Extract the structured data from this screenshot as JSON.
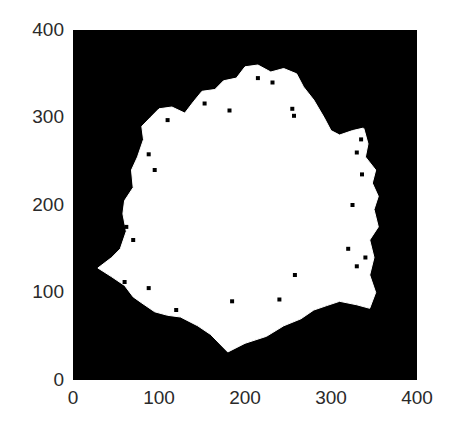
{
  "chart_data": {
    "type": "heatmap",
    "title": "",
    "xlabel": "",
    "ylabel": "",
    "xlim": [
      0,
      400
    ],
    "ylim": [
      0,
      400
    ],
    "x_ticks": [
      "0",
      "100",
      "200",
      "300",
      "400"
    ],
    "y_ticks": [
      "0",
      "100",
      "200",
      "300",
      "400"
    ],
    "grid": false,
    "legend": null,
    "colors": {
      "background": "#000000",
      "foreground": "#ffffff"
    },
    "blob_outline_approx": [
      [
        29,
        128
      ],
      [
        45,
        140
      ],
      [
        55,
        150
      ],
      [
        62,
        170
      ],
      [
        58,
        190
      ],
      [
        60,
        205
      ],
      [
        70,
        220
      ],
      [
        68,
        240
      ],
      [
        75,
        255
      ],
      [
        82,
        275
      ],
      [
        80,
        290
      ],
      [
        90,
        300
      ],
      [
        100,
        310
      ],
      [
        115,
        312
      ],
      [
        130,
        305
      ],
      [
        140,
        318
      ],
      [
        150,
        330
      ],
      [
        165,
        332
      ],
      [
        175,
        342
      ],
      [
        190,
        345
      ],
      [
        200,
        358
      ],
      [
        215,
        360
      ],
      [
        230,
        352
      ],
      [
        245,
        356
      ],
      [
        260,
        350
      ],
      [
        268,
        335
      ],
      [
        280,
        320
      ],
      [
        292,
        300
      ],
      [
        300,
        285
      ],
      [
        310,
        280
      ],
      [
        325,
        285
      ],
      [
        338,
        288
      ],
      [
        343,
        270
      ],
      [
        340,
        255
      ],
      [
        352,
        240
      ],
      [
        348,
        225
      ],
      [
        355,
        210
      ],
      [
        350,
        195
      ],
      [
        355,
        175
      ],
      [
        345,
        160
      ],
      [
        350,
        140
      ],
      [
        345,
        120
      ],
      [
        352,
        100
      ],
      [
        345,
        82
      ],
      [
        330,
        86
      ],
      [
        310,
        90
      ],
      [
        295,
        85
      ],
      [
        280,
        80
      ],
      [
        265,
        70
      ],
      [
        245,
        62
      ],
      [
        225,
        50
      ],
      [
        200,
        42
      ],
      [
        180,
        32
      ],
      [
        172,
        40
      ],
      [
        160,
        52
      ],
      [
        145,
        62
      ],
      [
        125,
        72
      ],
      [
        110,
        74
      ],
      [
        95,
        78
      ],
      [
        80,
        88
      ],
      [
        70,
        95
      ],
      [
        60,
        108
      ],
      [
        45,
        118
      ]
    ],
    "speckles_approx": [
      [
        215,
        345
      ],
      [
        232,
        340
      ],
      [
        255,
        310
      ],
      [
        257,
        302
      ],
      [
        153,
        316
      ],
      [
        182,
        308
      ],
      [
        110,
        297
      ],
      [
        88,
        258
      ],
      [
        95,
        240
      ],
      [
        62,
        175
      ],
      [
        70,
        160
      ],
      [
        40,
        110
      ],
      [
        60,
        112
      ],
      [
        65,
        95
      ],
      [
        88,
        105
      ],
      [
        120,
        80
      ],
      [
        185,
        90
      ],
      [
        240,
        92
      ],
      [
        258,
        120
      ],
      [
        320,
        150
      ],
      [
        330,
        130
      ],
      [
        340,
        140
      ],
      [
        325,
        200
      ],
      [
        336,
        235
      ],
      [
        330,
        260
      ],
      [
        335,
        275
      ],
      [
        340,
        290
      ]
    ]
  },
  "axes": {
    "y_ticks": [
      {
        "label": "400",
        "top": 20
      },
      {
        "label": "300",
        "top": 107
      },
      {
        "label": "200",
        "top": 195
      },
      {
        "label": "100",
        "top": 282
      },
      {
        "label": "0",
        "top": 370
      }
    ],
    "x_ticks": [
      {
        "label": "0",
        "left": 73
      },
      {
        "label": "100",
        "left": 159
      },
      {
        "label": "200",
        "left": 245
      },
      {
        "label": "300",
        "left": 331
      },
      {
        "label": "400",
        "left": 417
      }
    ]
  }
}
